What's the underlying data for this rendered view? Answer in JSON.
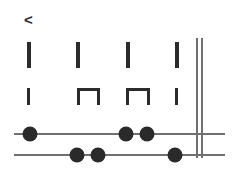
{
  "diagram": {
    "title_marker": "<",
    "colors": {
      "glyph": "#2b2b2b",
      "mark": "#2a2a2a",
      "line": "#707070",
      "background": "#ffffff"
    },
    "marker": {
      "symbol": "<",
      "x": 24,
      "y": 12
    },
    "row_ticks": {
      "label": "tick-row",
      "y": 42,
      "height": 26,
      "width": 4,
      "positions": [
        27,
        76,
        126,
        175
      ]
    },
    "row_brackets": {
      "label": "bracket-row",
      "y": 88,
      "height": 17,
      "stroke": 3,
      "items": [
        {
          "kind": "tick",
          "x": 27,
          "width": 3
        },
        {
          "kind": "bracket",
          "x": 77,
          "width": 23
        },
        {
          "kind": "bracket",
          "x": 126,
          "width": 24
        },
        {
          "kind": "tick",
          "x": 175,
          "width": 3
        }
      ]
    },
    "double_rule": {
      "label": "double-vertical-rule",
      "x1": 197,
      "x2": 202,
      "y_top": 38,
      "y_bottom": 158,
      "stroke": 2
    },
    "staff_lines": [
      {
        "name": "upper-line",
        "y": 134,
        "x_start": 14,
        "x_end": 225,
        "stroke": 2,
        "nodes": [
          30,
          126,
          147
        ],
        "node_radius": 7.5
      },
      {
        "name": "lower-line",
        "y": 155,
        "x_start": 14,
        "x_end": 225,
        "stroke": 2,
        "nodes": [
          77,
          98,
          175
        ],
        "node_radius": 7.5
      }
    ]
  }
}
